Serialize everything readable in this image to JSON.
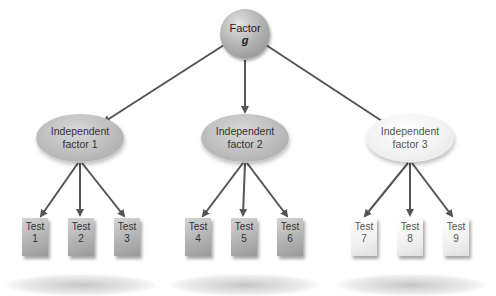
{
  "diagram": {
    "type": "hierarchy",
    "root": {
      "label_line1": "Factor",
      "label_line2": "g"
    },
    "factors": [
      {
        "label_line1": "Independent",
        "label_line2": "factor 1",
        "style": "gray",
        "tests": [
          {
            "line1": "Test",
            "line2": "1"
          },
          {
            "line1": "Test",
            "line2": "2"
          },
          {
            "line1": "Test",
            "line2": "3"
          }
        ]
      },
      {
        "label_line1": "Independent",
        "label_line2": "factor 2",
        "style": "gray",
        "tests": [
          {
            "line1": "Test",
            "line2": "4"
          },
          {
            "line1": "Test",
            "line2": "5"
          },
          {
            "line1": "Test",
            "line2": "6"
          }
        ]
      },
      {
        "label_line1": "Independent",
        "label_line2": "factor 3",
        "style": "light",
        "tests": [
          {
            "line1": "Test",
            "line2": "7"
          },
          {
            "line1": "Test",
            "line2": "8"
          },
          {
            "line1": "Test",
            "line2": "9"
          }
        ]
      }
    ],
    "colors": {
      "arrow": "#555555",
      "node_gray": "#b8b8b8",
      "node_light": "#f2f2f2"
    }
  }
}
